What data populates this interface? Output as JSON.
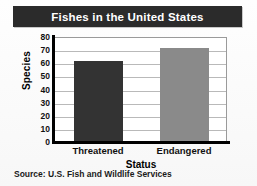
{
  "figure": {
    "title": "Fishes in the United States",
    "source": "Source: U.S. Fish and Wildlife Services",
    "title_bar_color": "#2b2b2b",
    "title_text_color": "#ffffff",
    "background_color": "#fdfdfd"
  },
  "chart_data": {
    "type": "bar",
    "title": "Fishes in the United States",
    "categories": [
      "Threatened",
      "Endangered"
    ],
    "values": [
      62,
      72
    ],
    "series": [
      {
        "name": "Species",
        "values": [
          62,
          72
        ],
        "colors": [
          "#333333",
          "#8a8a8a"
        ]
      }
    ],
    "xlabel": "Status",
    "ylabel": "Species",
    "ylim": [
      0,
      80
    ],
    "ytick_step": 10,
    "yticks": [
      80,
      70,
      60,
      50,
      40,
      30,
      20,
      10,
      0
    ],
    "grid": true,
    "grid_axis": "y",
    "legend": false,
    "annotations": [
      "Source: U.S. Fish and Wildlife Services"
    ]
  }
}
